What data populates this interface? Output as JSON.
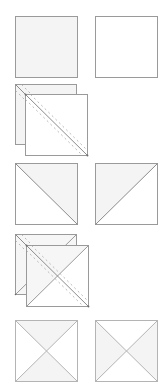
{
  "colors": {
    "outline": "#9a9a9a",
    "fill_shaded": "#f2f2f2",
    "fill_plain": "#ffffff",
    "dash": "#a8a8a8",
    "diagonal": "#8c8c8c"
  },
  "steps": [
    {
      "id": "step-1",
      "label": "Two fabric squares",
      "shapes": [
        {
          "name": "shaded-square",
          "x": 15,
          "y": 16,
          "size": 62,
          "fill": "shaded"
        },
        {
          "name": "plain-square",
          "x": 95,
          "y": 16,
          "size": 62,
          "fill": "plain"
        }
      ]
    },
    {
      "id": "step-2",
      "label": "Squares layered, diagonal drawn with stitching lines",
      "shapes": [
        {
          "name": "back-square",
          "x": 15,
          "y": 84,
          "size": 61
        },
        {
          "name": "front-square",
          "x": 25,
          "y": 94,
          "size": 62
        }
      ]
    },
    {
      "id": "step-3",
      "label": "Two half-square triangle units",
      "shapes": [
        {
          "name": "hst-unit-left",
          "x": 15,
          "y": 163,
          "size": 62,
          "shaded": "upper-right"
        },
        {
          "name": "hst-unit-right",
          "x": 95,
          "y": 163,
          "size": 62,
          "shaded": "upper-left"
        }
      ]
    },
    {
      "id": "step-4",
      "label": "HST units layered, diagonal drawn with stitching lines",
      "shapes": [
        {
          "name": "back-hst",
          "x": 15,
          "y": 234,
          "size": 61
        },
        {
          "name": "front-hst",
          "x": 26,
          "y": 245,
          "size": 62
        }
      ]
    },
    {
      "id": "step-5",
      "label": "Two hourglass units",
      "shapes": [
        {
          "name": "hourglass-left",
          "x": 15,
          "y": 320,
          "size": 62,
          "shaded": "top-bottom"
        },
        {
          "name": "hourglass-right",
          "x": 95,
          "y": 320,
          "size": 62,
          "shaded": "left-right"
        }
      ]
    }
  ]
}
